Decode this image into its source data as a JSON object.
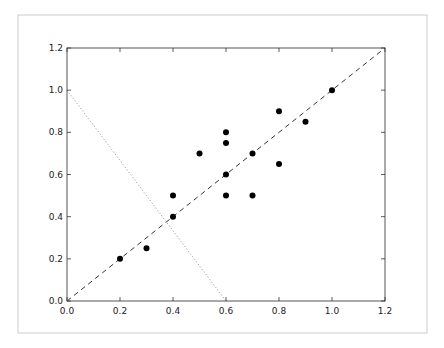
{
  "figure": {
    "frame_color": "#cccccc",
    "axis_color": "#555555"
  },
  "chart_data": {
    "type": "scatter",
    "title": "",
    "xlabel": "",
    "ylabel": "",
    "xlim": [
      0.0,
      1.2
    ],
    "ylim": [
      0.0,
      1.2
    ],
    "grid": false,
    "x_ticks": [
      "0.0",
      "0.2",
      "0.4",
      "0.6",
      "0.8",
      "1.0",
      "1.2"
    ],
    "y_ticks": [
      "0.0",
      "0.2",
      "0.4",
      "0.6",
      "0.8",
      "1.0",
      "1.2"
    ],
    "series": [
      {
        "name": "points",
        "marker": "circle",
        "color": "#000000",
        "x": [
          0.2,
          0.3,
          0.4,
          0.4,
          0.5,
          0.6,
          0.6,
          0.6,
          0.6,
          0.7,
          0.7,
          0.8,
          0.8,
          0.9,
          1.0
        ],
        "y": [
          0.2,
          0.25,
          0.4,
          0.5,
          0.7,
          0.8,
          0.75,
          0.6,
          0.5,
          0.7,
          0.5,
          0.65,
          0.9,
          0.85,
          1.0
        ]
      }
    ],
    "lines": [
      {
        "name": "identity-dashed",
        "style": "dashed",
        "color": "#333333",
        "x": [
          0.0,
          1.2
        ],
        "y": [
          0.0,
          1.2
        ]
      },
      {
        "name": "perpendicular-dotted",
        "style": "dotted",
        "color": "#888888",
        "x": [
          0.0,
          0.6
        ],
        "y": [
          1.0,
          0.0
        ]
      }
    ]
  }
}
